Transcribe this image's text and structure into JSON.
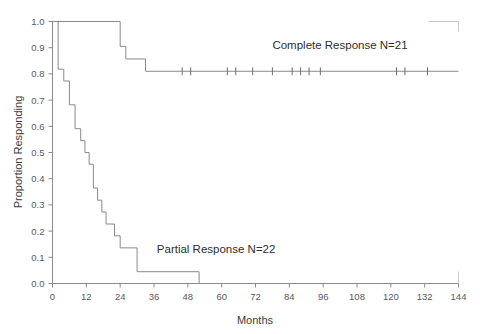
{
  "chart_data": {
    "type": "line",
    "subtype": "kaplan-meier-step",
    "title": "",
    "xlabel": "Months",
    "ylabel": "Proportion Responding",
    "xlim": [
      0,
      144
    ],
    "ylim": [
      0.0,
      1.0
    ],
    "xticks": [
      0,
      12,
      24,
      36,
      48,
      60,
      72,
      84,
      96,
      108,
      120,
      132,
      144
    ],
    "xticklabels": [
      "0",
      "12",
      "24",
      "36",
      "48",
      "60",
      "72",
      "84",
      "96",
      "108",
      "120",
      "132",
      "144"
    ],
    "yticks": [
      0.0,
      0.1,
      0.2,
      0.3,
      0.4,
      0.5,
      0.6,
      0.7,
      0.8,
      0.9,
      1.0
    ],
    "yticklabels": [
      "0.0",
      "0.1",
      "0.2",
      "0.3",
      "0.4",
      "0.5",
      "0.6",
      "0.7",
      "0.8",
      "0.9",
      "1.0"
    ],
    "grid": false,
    "legend_position": "inline-annotation",
    "series": [
      {
        "name": "Complete Response",
        "n": 21,
        "label": "Complete Response  N=21",
        "label_x": 78,
        "label_y": 0.895,
        "color": "#8a8a8a",
        "steps_x": [
          0,
          24,
          26,
          33,
          144
        ],
        "steps_y": [
          1.0,
          0.905,
          0.857,
          0.81,
          0.81
        ],
        "censor_x": [
          46,
          49,
          62,
          65,
          71,
          78,
          85,
          88,
          91,
          95,
          122,
          125,
          133
        ],
        "censor_y": 0.81
      },
      {
        "name": "Partial Response",
        "n": 22,
        "label": "Partial Response  N=22",
        "label_x": 37,
        "label_y": 0.115,
        "color": "#8a8a8a",
        "steps_x": [
          0,
          2,
          4,
          6,
          8,
          10,
          11.5,
          13,
          14.5,
          16,
          17.5,
          19,
          20.5,
          22,
          24,
          30,
          52
        ],
        "steps_y": [
          1.0,
          0.818,
          0.773,
          0.682,
          0.591,
          0.545,
          0.5,
          0.455,
          0.364,
          0.318,
          0.273,
          0.227,
          0.227,
          0.182,
          0.136,
          0.045,
          0.0
        ],
        "censor_x": [],
        "censor_y": 0.0
      }
    ]
  },
  "axis": {
    "x_title": "Months",
    "y_title": "Proportion Responding"
  }
}
